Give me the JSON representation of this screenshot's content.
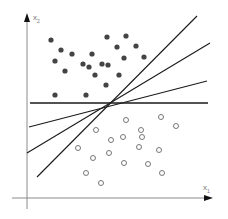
{
  "diagram": {
    "type": "scatter-classification",
    "colors": {
      "axis": "#8a8a8a",
      "line": "#1a1a1a",
      "filled_point": "#444444",
      "hollow_point": "#777777",
      "background": "#ffffff"
    },
    "axes": {
      "x": {
        "label": "x",
        "subscript": "1"
      },
      "y": {
        "label": "x",
        "subscript": "2"
      }
    },
    "intersection": [
      107,
      103
    ],
    "lines": [
      {
        "x1": 30,
        "y1": 103,
        "x2": 208,
        "y2": 103
      },
      {
        "x1": 29,
        "y1": 127,
        "x2": 207,
        "y2": 81
      },
      {
        "x1": 27,
        "y1": 153,
        "x2": 210,
        "y2": 43
      },
      {
        "x1": 37,
        "y1": 177,
        "x2": 197,
        "y2": 16
      }
    ],
    "filled_points": [
      [
        51,
        40
      ],
      [
        61,
        50
      ],
      [
        72,
        54
      ],
      [
        55,
        61
      ],
      [
        65,
        71
      ],
      [
        83,
        64
      ],
      [
        89,
        67
      ],
      [
        92,
        54
      ],
      [
        95,
        75
      ],
      [
        102,
        64
      ],
      [
        108,
        65
      ],
      [
        106,
        85
      ],
      [
        55,
        95
      ],
      [
        86,
        95
      ],
      [
        107,
        37
      ],
      [
        126,
        36
      ],
      [
        117,
        47
      ],
      [
        136,
        46
      ],
      [
        124,
        58
      ],
      [
        144,
        57
      ],
      [
        119,
        75
      ]
    ],
    "hollow_points": [
      [
        96,
        130
      ],
      [
        111,
        140
      ],
      [
        78,
        148
      ],
      [
        93,
        158
      ],
      [
        109,
        153
      ],
      [
        86,
        173
      ],
      [
        101,
        183
      ],
      [
        126,
        120
      ],
      [
        161,
        117
      ],
      [
        176,
        126
      ],
      [
        141,
        130
      ],
      [
        142,
        137
      ],
      [
        123,
        137
      ],
      [
        139,
        147
      ],
      [
        159,
        150
      ],
      [
        124,
        163
      ],
      [
        148,
        164
      ],
      [
        162,
        173
      ]
    ]
  }
}
